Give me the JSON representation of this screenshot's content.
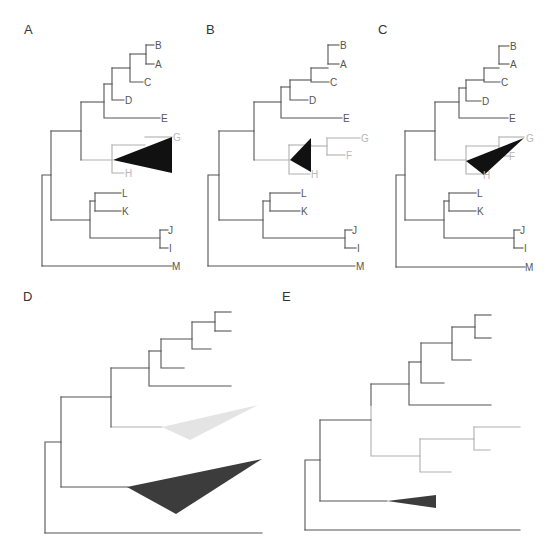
{
  "figure": {
    "colors": {
      "dark_edge": "#555555",
      "light_edge": "#b0b0b0",
      "dark_text": "#555555",
      "light_text": "#b8b8b8",
      "collapsed_dark": "#111111",
      "collapsed_mid": "#3c3c3c",
      "collapsed_light": "#e4e4e4",
      "panel_label": "#333333"
    },
    "panels": [
      {
        "id": "A",
        "label": "A",
        "label_pos": [
          24,
          34
        ],
        "edges_dark": [
          "M42,266 V175 H51",
          "M42,266 H172",
          "M51,131 V220",
          "M51,131 H81",
          "M51,220 H90",
          "M81,102 V160",
          "M81,102 H104",
          "M104,84 V118 H160",
          "M104,84 H112",
          "M112,68 V100 H124",
          "M112,68 H130",
          "M130,54 V82 H143",
          "M130,54 H146",
          "M146,45 V64",
          "M146,45 H154",
          "M146,64 H154",
          "M90,201 V238 H160",
          "M90,201 H95",
          "M95,193 V211",
          "M95,193 H121",
          "M95,211 H121",
          "M160,230 V248",
          "M160,230 H168",
          "M160,248 H168"
        ],
        "edges_light": [
          "M81,160 H112",
          "M112,145 V173 H124",
          "M112,145 H145",
          "M145,137 H172"
        ],
        "triangles": [
          {
            "points": "113,160 172,137 172,173",
            "tone": "collapsed_dark"
          }
        ],
        "tips": [
          {
            "text": "B",
            "x": 155,
            "y": 49,
            "tone": "dark"
          },
          {
            "text": "A",
            "x": 155,
            "y": 68,
            "tone": "dark"
          },
          {
            "text": "C",
            "x": 144,
            "y": 86,
            "tone": "dark"
          },
          {
            "text": "D",
            "x": 125,
            "y": 104,
            "tone": "dark"
          },
          {
            "text": "E",
            "x": 161,
            "y": 122,
            "tone": "dark"
          },
          {
            "text": "G",
            "x": 173,
            "y": 141,
            "tone": "light"
          },
          {
            "text": "H",
            "x": 125,
            "y": 177,
            "tone": "light"
          },
          {
            "text": "L",
            "x": 122,
            "y": 197,
            "tone": "dark"
          },
          {
            "text": "K",
            "x": 122,
            "y": 215,
            "tone": "dark"
          },
          {
            "text": "J",
            "x": 168,
            "y": 234,
            "tone": "dark"
          },
          {
            "text": "I",
            "x": 169,
            "y": 252,
            "tone": "dark"
          },
          {
            "text": "M",
            "x": 172,
            "y": 270,
            "tone": "dark"
          }
        ]
      },
      {
        "id": "B",
        "label": "B",
        "label_pos": [
          206,
          34
        ],
        "edges_dark": [
          "M208,266 V175 H219",
          "M208,266 H355",
          "M219,131 V220",
          "M219,131 H254",
          "M219,220 H263",
          "M254,102 V160",
          "M254,102 H281",
          "M281,87 V118 H342",
          "M281,87 H290",
          "M290,80 V100 H308",
          "M290,80 H311",
          "M311,68 V82 H329",
          "M311,68 H328",
          "M328,45 V64",
          "M328,45 H339",
          "M328,64 H339",
          "M263,201 V238 H345",
          "M263,201 H270",
          "M270,193 V211",
          "M270,193 H300",
          "M270,211 H300",
          "M345,230 V248",
          "M345,230 H352",
          "M345,248 H356"
        ],
        "edges_light": [
          "M254,160 H289",
          "M289,145 V174 H310",
          "M289,145 H311",
          "M311,146 H327",
          "M327,138 V155",
          "M327,138 H360",
          "M327,155 H345"
        ],
        "triangles": [
          {
            "points": "290,160 311,138 311,172",
            "tone": "collapsed_dark"
          }
        ],
        "tips": [
          {
            "text": "B",
            "x": 340,
            "y": 49,
            "tone": "dark"
          },
          {
            "text": "A",
            "x": 340,
            "y": 68,
            "tone": "dark"
          },
          {
            "text": "C",
            "x": 330,
            "y": 86,
            "tone": "dark"
          },
          {
            "text": "D",
            "x": 309,
            "y": 104,
            "tone": "dark"
          },
          {
            "text": "E",
            "x": 343,
            "y": 122,
            "tone": "dark"
          },
          {
            "text": "G",
            "x": 361,
            "y": 142,
            "tone": "light"
          },
          {
            "text": "F",
            "x": 346,
            "y": 159,
            "tone": "light"
          },
          {
            "text": "H",
            "x": 311,
            "y": 178,
            "tone": "light"
          },
          {
            "text": "L",
            "x": 301,
            "y": 197,
            "tone": "dark"
          },
          {
            "text": "K",
            "x": 301,
            "y": 215,
            "tone": "dark"
          },
          {
            "text": "J",
            "x": 352,
            "y": 234,
            "tone": "dark"
          },
          {
            "text": "I",
            "x": 357,
            "y": 252,
            "tone": "dark"
          },
          {
            "text": "M",
            "x": 356,
            "y": 270,
            "tone": "dark"
          }
        ]
      },
      {
        "id": "C",
        "label": "C",
        "label_pos": [
          378,
          34
        ],
        "edges_dark": [
          "M396,267 V175 H405",
          "M396,267 H525",
          "M405,131 V220",
          "M405,131 H435",
          "M405,220 H444",
          "M435,102 V160",
          "M435,102 H459",
          "M459,88 V118 H508",
          "M459,88 H466",
          "M466,80 V101 H481",
          "M466,80 H484",
          "M484,68 V82 H500",
          "M484,68 H499",
          "M499,46 V64",
          "M499,46 H509",
          "M499,64 H509",
          "M444,201 V238 H514",
          "M444,201 H449",
          "M449,193 V211",
          "M449,193 H476",
          "M449,211 H476",
          "M514,230 V248",
          "M514,230 H520",
          "M514,248 H523"
        ],
        "edges_light": [
          "M435,160 H466",
          "M466,146 V174 H484",
          "M466,146 H499",
          "M499,137 V156",
          "M499,137 H524",
          "M499,156 H510"
        ],
        "triangles": [
          {
            "points": "466,161 524,138 484,175",
            "tone": "collapsed_dark"
          }
        ],
        "tips": [
          {
            "text": "B",
            "x": 510,
            "y": 50,
            "tone": "dark"
          },
          {
            "text": "A",
            "x": 510,
            "y": 68,
            "tone": "dark"
          },
          {
            "text": "C",
            "x": 501,
            "y": 86,
            "tone": "dark"
          },
          {
            "text": "D",
            "x": 482,
            "y": 105,
            "tone": "dark"
          },
          {
            "text": "E",
            "x": 509,
            "y": 122,
            "tone": "dark"
          },
          {
            "text": "G",
            "x": 526,
            "y": 142,
            "tone": "light"
          },
          {
            "text": "F",
            "x": 509,
            "y": 160,
            "tone": "light"
          },
          {
            "text": "H",
            "x": 483,
            "y": 179,
            "tone": "light"
          },
          {
            "text": "L",
            "x": 477,
            "y": 197,
            "tone": "dark"
          },
          {
            "text": "K",
            "x": 477,
            "y": 215,
            "tone": "dark"
          },
          {
            "text": "J",
            "x": 520,
            "y": 234,
            "tone": "dark"
          },
          {
            "text": "I",
            "x": 524,
            "y": 252,
            "tone": "dark"
          },
          {
            "text": "M",
            "x": 525,
            "y": 271,
            "tone": "dark"
          }
        ]
      },
      {
        "id": "D",
        "label": "D",
        "label_pos": [
          23,
          301
        ],
        "edges_dark": [
          "M45,533 V442 H61",
          "M45,533 H262",
          "M61,397 V487",
          "M61,397 H111",
          "M61,487 H128",
          "M111,368 V427",
          "M111,368 H149",
          "M149,351 V386 H231",
          "M149,351 H161",
          "M161,339 V368 H184",
          "M161,339 H192",
          "M192,322 V349 H211",
          "M192,322 H215",
          "M215,312 V331",
          "M215,312 H231",
          "M215,331 H231"
        ],
        "edges_light": [
          "M111,427 H162"
        ],
        "triangles": [
          {
            "points": "162,427 258,405 190,440",
            "tone": "collapsed_light"
          },
          {
            "points": "127,487 262,459 176,514",
            "tone": "collapsed_mid"
          }
        ],
        "tips": []
      },
      {
        "id": "E",
        "label": "E",
        "label_pos": [
          282,
          301
        ],
        "edges_dark": [
          "M305,530 V460 H320",
          "M305,530 H520",
          "M320,420 V501",
          "M320,420 H371",
          "M320,501 H387",
          "M371,384 V405",
          "M371,384 H409",
          "M409,362 V405 H491",
          "M409,362 H421",
          "M421,343 V383 H444",
          "M421,343 H452",
          "M452,327 V360 H471",
          "M452,327 H475",
          "M475,315 V338",
          "M475,315 H491",
          "M475,338 H491"
        ],
        "edges_light": [
          "M371,405 V456 H420",
          "M420,439 V472 H451",
          "M420,439 H474",
          "M474,427 V450 H490",
          "M474,427 H520"
        ],
        "triangles": [
          {
            "points": "387,501 436,495 436,508",
            "tone": "collapsed_mid"
          }
        ],
        "tips": []
      }
    ]
  }
}
